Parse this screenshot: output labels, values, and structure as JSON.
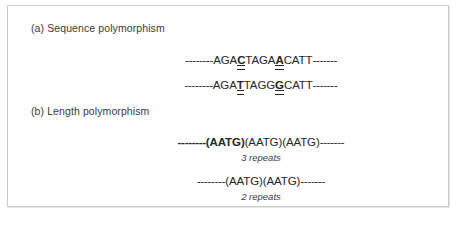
{
  "figure": {
    "panels": [
      {
        "id": "a",
        "label": "(a) Sequence polymorphism",
        "type": "sequence-polymorphism",
        "sequences": [
          {
            "name": "allele-1",
            "full_text": "--------AGACTAGACATT-------",
            "flank_left": "--------",
            "flank_right": "-------",
            "segments": [
              {
                "text": "AGA",
                "variant": false
              },
              {
                "text": "C",
                "variant": true
              },
              {
                "text": "TAGA",
                "variant": false
              },
              {
                "text": "A",
                "variant": true
              },
              {
                "text": "CATT",
                "variant": false
              }
            ],
            "variant_bases": [
              "C",
              "A"
            ]
          },
          {
            "name": "allele-2",
            "full_text": "--------AGATTAGGCATT-------",
            "flank_left": "--------",
            "flank_right": "-------",
            "segments": [
              {
                "text": "AGA",
                "variant": false
              },
              {
                "text": "T",
                "variant": true
              },
              {
                "text": "TAGG",
                "variant": false
              },
              {
                "text": "G",
                "variant": true
              },
              {
                "text": "CATT",
                "variant": false
              }
            ],
            "variant_bases": [
              "T",
              "G"
            ]
          }
        ]
      },
      {
        "id": "b",
        "label": "(b) Length polymorphism",
        "type": "length-polymorphism",
        "alleles": [
          {
            "name": "allele-3-repeats",
            "full_text": "--------(AATG)(AATG)(AATG)-------",
            "flank_left": "--------",
            "flank_right": "-------",
            "repeat_unit": "(AATG)",
            "repeat_count": 3,
            "first_unit_bold": true,
            "caption": "3 repeats"
          },
          {
            "name": "allele-2-repeats",
            "full_text": "--------(AATG)(AATG)-------",
            "flank_left": "--------",
            "flank_right": "-------",
            "repeat_unit": "(AATG)",
            "repeat_count": 2,
            "first_unit_bold": false,
            "caption": "2 repeats"
          }
        ]
      }
    ]
  },
  "colors": {
    "panel_border": "#c9c9c9",
    "background": "#ffffff",
    "text": "#262626",
    "label_text": "#3a3a3a"
  }
}
